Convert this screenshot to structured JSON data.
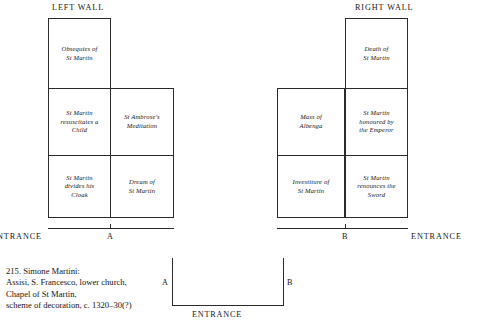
{
  "figure": {
    "left_wall_heading": "LEFT WALL",
    "right_wall_heading": "RIGHT WALL"
  },
  "left_wall": {
    "scenes": [
      {
        "id": "obsequies",
        "label": "Obsequies of\nSt Martin"
      },
      {
        "id": "resuscitates",
        "label": "St Martin\nresuscitates a\nChild"
      },
      {
        "id": "ambrose",
        "label": "St Ambrose's\nMeditation"
      },
      {
        "id": "divides",
        "label": "St Martin\ndivides his\nCloak"
      },
      {
        "id": "dream",
        "label": "Dream of\nSt Martin"
      }
    ],
    "entrance_label": "NTRANCE",
    "point_label": "A"
  },
  "right_wall": {
    "scenes": [
      {
        "id": "death",
        "label": "Death of\nSt Martin"
      },
      {
        "id": "mass",
        "label": "Mass of\nAlbenga"
      },
      {
        "id": "honoured",
        "label": "St Martin\nhonoured by\nthe Emperor"
      },
      {
        "id": "investiture",
        "label": "Investiture of\nSt Martin"
      },
      {
        "id": "renounces",
        "label": "St Martin\nrenounces the\nSword"
      }
    ],
    "point_label": "B",
    "entrance_label": "ENTRANCE"
  },
  "caption": {
    "lines": [
      "215.  Simone Martini:",
      "Assisi, S. Francesco, lower church,",
      "Chapel of St Martin,",
      "scheme of decoration, c. 1320–30(?)"
    ]
  },
  "plan": {
    "point_a": "A",
    "point_b": "B",
    "entrance": "ENTRANCE"
  },
  "colors": {
    "ink": "#2b2b2b",
    "text": "#141414",
    "background": "#ffffff"
  }
}
